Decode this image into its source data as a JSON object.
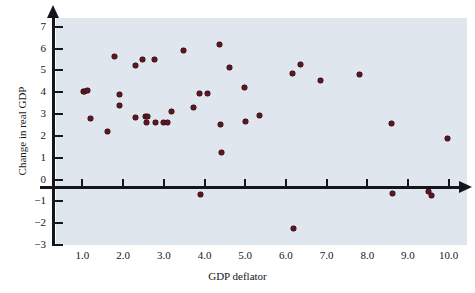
{
  "chart_data": {
    "type": "scatter",
    "title": "",
    "xlabel": "GDP deflator",
    "ylabel": "Change in real GDP",
    "xlim": [
      0.35,
      10.45
    ],
    "ylim": [
      -3,
      7.4
    ],
    "grid": false,
    "legend": null,
    "xticks": [
      1.0,
      2.0,
      3.0,
      4.0,
      5.0,
      6.0,
      7.0,
      8.0,
      9.0,
      10.0
    ],
    "xtick_labels": [
      "1.0",
      "2.0",
      "3.0",
      "4.0",
      "5.0",
      "6.0",
      "7.0",
      "8.0",
      "9.0",
      "10.0"
    ],
    "yticks": [
      7,
      6,
      5,
      4,
      3,
      2,
      1,
      0,
      -1,
      -2,
      -3
    ],
    "ytick_labels": [
      "7",
      "6",
      "5",
      "4",
      "3",
      "2",
      "1",
      "0",
      "−1",
      "−2",
      "−3"
    ],
    "marker_color": "#5e1622",
    "panel_color": "#dfe6ee",
    "axis_color": "#14161d",
    "points": [
      {
        "x": 1.02,
        "y": 4.02
      },
      {
        "x": 1.06,
        "y": 4.04
      },
      {
        "x": 1.13,
        "y": 4.1
      },
      {
        "x": 1.2,
        "y": 2.8
      },
      {
        "x": 1.62,
        "y": 2.22
      },
      {
        "x": 1.78,
        "y": 5.65
      },
      {
        "x": 1.9,
        "y": 3.9
      },
      {
        "x": 1.92,
        "y": 3.4
      },
      {
        "x": 2.3,
        "y": 5.22
      },
      {
        "x": 2.3,
        "y": 2.85
      },
      {
        "x": 2.48,
        "y": 5.52
      },
      {
        "x": 2.55,
        "y": 2.88
      },
      {
        "x": 2.6,
        "y": 2.88
      },
      {
        "x": 2.58,
        "y": 2.6
      },
      {
        "x": 2.78,
        "y": 5.52
      },
      {
        "x": 2.8,
        "y": 2.6
      },
      {
        "x": 3.0,
        "y": 2.6
      },
      {
        "x": 3.08,
        "y": 2.62
      },
      {
        "x": 3.18,
        "y": 3.12
      },
      {
        "x": 3.48,
        "y": 5.9
      },
      {
        "x": 3.72,
        "y": 3.3
      },
      {
        "x": 3.88,
        "y": 3.95
      },
      {
        "x": 3.9,
        "y": -0.68
      },
      {
        "x": 4.08,
        "y": 3.95
      },
      {
        "x": 4.38,
        "y": 6.2
      },
      {
        "x": 4.4,
        "y": 2.52
      },
      {
        "x": 4.42,
        "y": 1.22
      },
      {
        "x": 4.62,
        "y": 5.15
      },
      {
        "x": 4.98,
        "y": 4.2
      },
      {
        "x": 5.0,
        "y": 2.68
      },
      {
        "x": 5.35,
        "y": 2.92
      },
      {
        "x": 6.15,
        "y": 4.88
      },
      {
        "x": 6.18,
        "y": -2.25
      },
      {
        "x": 6.35,
        "y": 5.25
      },
      {
        "x": 6.85,
        "y": 4.55
      },
      {
        "x": 7.82,
        "y": 4.8
      },
      {
        "x": 8.6,
        "y": 2.55
      },
      {
        "x": 8.62,
        "y": -0.62
      },
      {
        "x": 9.5,
        "y": -0.55
      },
      {
        "x": 9.58,
        "y": -0.75
      },
      {
        "x": 9.98,
        "y": 1.88
      }
    ]
  }
}
